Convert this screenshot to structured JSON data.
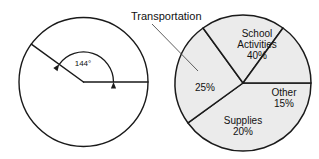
{
  "figure": {
    "background_color": "#ffffff",
    "line_color": "#1a1a1a"
  },
  "angle_diagram": {
    "name": "central-angle-circle",
    "center_x": 83.5,
    "center_y": 82,
    "radius": 64.5,
    "fill_color": "#ffffff",
    "angle_label": "144°",
    "angle_value": 144,
    "angle_label_x": 83,
    "angle_label_y": 64,
    "ray_start_angle_deg": 0,
    "ray_end_angle_deg": 144,
    "arc_radius": 30
  },
  "callout": {
    "name": "transportation-callout",
    "label": "Transportation",
    "label_x": 131,
    "label_y": 17,
    "leader_from_x": 152,
    "leader_from_y": 24,
    "leader_to_x": 198,
    "leader_to_y": 71
  },
  "chart_data": {
    "type": "pie",
    "title": "Transportation",
    "xlabel": "",
    "ylabel": "",
    "center_x": 243,
    "center_y": 83,
    "radius": 68,
    "start_angle_deg": 0,
    "direction": "clockwise",
    "fill_color": "#ebebeb",
    "stroke_color": "#1a1a1a",
    "legend_position": "inside-slices",
    "grid": false,
    "categories": [
      "School Activities",
      "Transportation",
      "Supplies",
      "Other"
    ],
    "values": [
      40,
      25,
      20,
      15
    ],
    "unit": "%",
    "slices": [
      {
        "name": "School Activities",
        "value": 40,
        "value_label": "40%",
        "angle_deg": 144,
        "label_line_1": "School",
        "label_line_2": "Activities",
        "label_line_3": "40%",
        "label_x": 257,
        "label_y": 45,
        "label_inside": true
      },
      {
        "name": "Transportation",
        "value": 25,
        "value_label": "25%",
        "angle_deg": 90,
        "label_line_1": "25%",
        "label_x": 205,
        "label_y": 88,
        "label_inside": true,
        "external_label": "Transportation"
      },
      {
        "name": "Supplies",
        "value": 20,
        "value_label": "20%",
        "angle_deg": 72,
        "label_line_1": "Supplies",
        "label_line_2": "20%",
        "label_x": 243,
        "label_y": 126,
        "label_inside": true
      },
      {
        "name": "Other",
        "value": 15,
        "value_label": "15%",
        "angle_deg": 54,
        "label_line_1": "Other",
        "label_line_2": "15%",
        "label_x": 284,
        "label_y": 98,
        "label_inside": true
      }
    ]
  }
}
